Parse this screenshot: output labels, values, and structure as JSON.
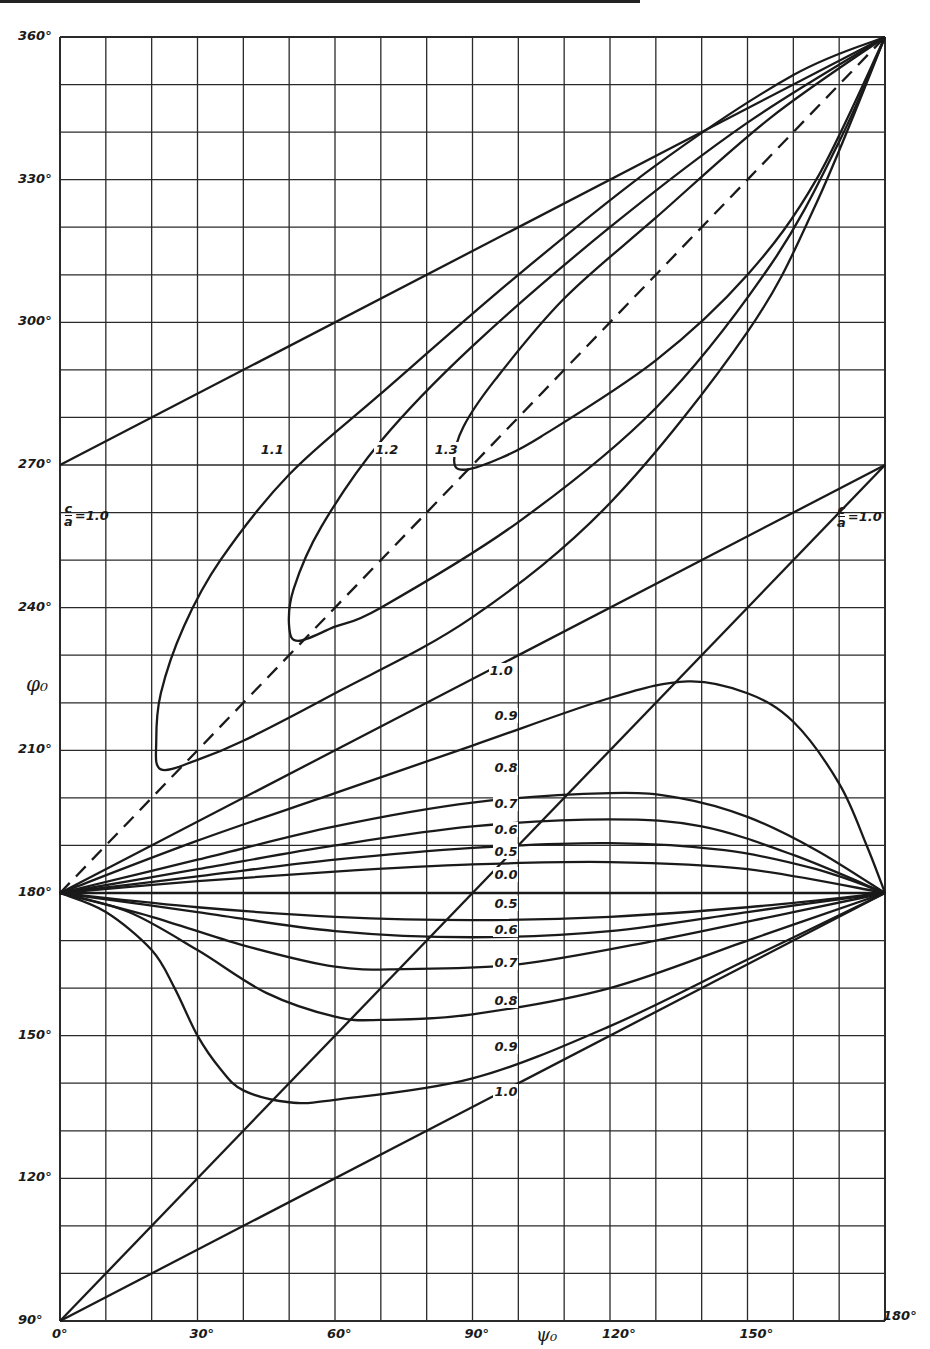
{
  "chart_data": {
    "type": "line",
    "title": "",
    "xlabel": "ψ₀",
    "ylabel": "φ₀",
    "xlim": [
      0,
      180
    ],
    "ylim": [
      90,
      360
    ],
    "grid": true,
    "grid_step": {
      "x": 10,
      "y": 10
    },
    "x_ticks": [
      {
        "value": 0,
        "label": "0°"
      },
      {
        "value": 30,
        "label": "30°"
      },
      {
        "value": 60,
        "label": "60°"
      },
      {
        "value": 90,
        "label": "90°"
      },
      {
        "value": 120,
        "label": "120°"
      },
      {
        "value": 150,
        "label": "150°"
      },
      {
        "value": 180,
        "label": "180°"
      }
    ],
    "y_ticks": [
      {
        "value": 360,
        "label": "360°"
      },
      {
        "value": 330,
        "label": "330°"
      },
      {
        "value": 300,
        "label": "300°"
      },
      {
        "value": 270,
        "label": "270°"
      },
      {
        "value": 240,
        "label": "240°"
      },
      {
        "value": 210,
        "label": "210°"
      },
      {
        "value": 180,
        "label": "180°"
      },
      {
        "value": 150,
        "label": "150°"
      },
      {
        "value": 120,
        "label": "120°"
      },
      {
        "value": 90,
        "label": "90°"
      }
    ],
    "parameter": "c/a",
    "series": [
      {
        "name": "c/a = 1.0 (upper bound)",
        "label": "",
        "dash": false,
        "points": [
          [
            0,
            270
          ],
          [
            180,
            360
          ]
        ]
      },
      {
        "name": "c/a = 1.0 (lower bound)",
        "label": "",
        "dash": false,
        "points": [
          [
            0,
            90
          ],
          [
            180,
            270
          ]
        ]
      },
      {
        "name": "diagonal",
        "label": "",
        "dash": true,
        "points": [
          [
            0,
            180
          ],
          [
            180,
            360
          ]
        ]
      },
      {
        "name": "1.1",
        "label": "1.1",
        "label_at": [
          44,
          273
        ],
        "dash": false,
        "points": [
          [
            180,
            360
          ],
          [
            160,
            352
          ],
          [
            130,
            333
          ],
          [
            100,
            310
          ],
          [
            70,
            285
          ],
          [
            50,
            268
          ],
          [
            35,
            250
          ],
          [
            27,
            236
          ],
          [
            22,
            222
          ],
          [
            21,
            212
          ],
          [
            22,
            206
          ],
          [
            30,
            208
          ],
          [
            40,
            212
          ],
          [
            60,
            222
          ],
          [
            90,
            238
          ],
          [
            120,
            262
          ],
          [
            150,
            298
          ],
          [
            165,
            325
          ],
          [
            180,
            360
          ]
        ]
      },
      {
        "name": "1.2",
        "label": "1.2",
        "label_at": [
          69,
          273
        ],
        "dash": false,
        "points": [
          [
            180,
            360
          ],
          [
            150,
            342
          ],
          [
            120,
            320
          ],
          [
            90,
            295
          ],
          [
            70,
            275
          ],
          [
            57,
            257
          ],
          [
            51,
            244
          ],
          [
            50,
            236
          ],
          [
            52,
            233
          ],
          [
            60,
            236
          ],
          [
            70,
            240
          ],
          [
            100,
            258
          ],
          [
            130,
            282
          ],
          [
            155,
            312
          ],
          [
            170,
            338
          ],
          [
            180,
            360
          ]
        ]
      },
      {
        "name": "1.3",
        "label": "1.3",
        "label_at": [
          82,
          273
        ],
        "dash": false,
        "points": [
          [
            180,
            360
          ],
          [
            155,
            343
          ],
          [
            130,
            322
          ],
          [
            110,
            305
          ],
          [
            95,
            288
          ],
          [
            88,
            278
          ],
          [
            86,
            271
          ],
          [
            88,
            269
          ],
          [
            95,
            271
          ],
          [
            105,
            276
          ],
          [
            130,
            292
          ],
          [
            150,
            310
          ],
          [
            165,
            330
          ],
          [
            180,
            360
          ]
        ]
      },
      {
        "name": "1.0 (upper fan)",
        "label": "1.0",
        "label_at": [
          94,
          226.5
        ],
        "dash": false,
        "points": [
          [
            0,
            180
          ],
          [
            180,
            270
          ]
        ]
      },
      {
        "name": "0.9 (upper)",
        "label": "0.9",
        "label_at": [
          95,
          217
        ],
        "dash": false,
        "points": [
          [
            0,
            180
          ],
          [
            30,
            191
          ],
          [
            60,
            201
          ],
          [
            90,
            211
          ],
          [
            120,
            221
          ],
          [
            137,
            224.5
          ],
          [
            150,
            222
          ],
          [
            160,
            216
          ],
          [
            170,
            203
          ],
          [
            176,
            190
          ],
          [
            180,
            180
          ]
        ]
      },
      {
        "name": "0.8 (upper)",
        "label": "0.8",
        "label_at": [
          95,
          206
        ],
        "dash": false,
        "points": [
          [
            0,
            180
          ],
          [
            30,
            187
          ],
          [
            60,
            194
          ],
          [
            90,
            199
          ],
          [
            120,
            201
          ],
          [
            135,
            200
          ],
          [
            150,
            196
          ],
          [
            165,
            189
          ],
          [
            180,
            180
          ]
        ]
      },
      {
        "name": "0.7 (upper)",
        "label": "0.7",
        "label_at": [
          95,
          198.5
        ],
        "dash": false,
        "points": [
          [
            0,
            180
          ],
          [
            30,
            185
          ],
          [
            60,
            190
          ],
          [
            90,
            194
          ],
          [
            120,
            195.5
          ],
          [
            140,
            194
          ],
          [
            160,
            188
          ],
          [
            180,
            180
          ]
        ]
      },
      {
        "name": "0.6 (upper)",
        "label": "0.6",
        "label_at": [
          95,
          193
        ],
        "dash": false,
        "points": [
          [
            0,
            180
          ],
          [
            30,
            183.5
          ],
          [
            60,
            187
          ],
          [
            90,
            189.5
          ],
          [
            120,
            190.5
          ],
          [
            145,
            189
          ],
          [
            165,
            185
          ],
          [
            180,
            180
          ]
        ]
      },
      {
        "name": "0.5 (upper)",
        "label": "0.5",
        "label_at": [
          95,
          188.5
        ],
        "dash": false,
        "points": [
          [
            0,
            180
          ],
          [
            30,
            182.5
          ],
          [
            60,
            184.5
          ],
          [
            90,
            186
          ],
          [
            120,
            186.5
          ],
          [
            150,
            185
          ],
          [
            180,
            180
          ]
        ]
      },
      {
        "name": "0.0",
        "label": "0.0",
        "label_at": [
          95,
          183.5
        ],
        "dash": false,
        "points": [
          [
            0,
            180
          ],
          [
            180,
            180
          ]
        ]
      },
      {
        "name": "0.5 (lower)",
        "label": "0.5",
        "label_at": [
          95,
          177.5
        ],
        "dash": false,
        "points": [
          [
            0,
            180
          ],
          [
            30,
            177
          ],
          [
            60,
            175
          ],
          [
            90,
            174.3
          ],
          [
            120,
            175
          ],
          [
            150,
            177
          ],
          [
            180,
            180
          ]
        ]
      },
      {
        "name": "0.6 (lower)",
        "label": "0.6",
        "label_at": [
          95,
          172
        ],
        "dash": false,
        "points": [
          [
            0,
            180
          ],
          [
            30,
            176
          ],
          [
            60,
            172
          ],
          [
            90,
            170.7
          ],
          [
            120,
            172
          ],
          [
            150,
            176
          ],
          [
            180,
            180
          ]
        ]
      },
      {
        "name": "0.7 (lower)",
        "label": "0.7",
        "label_at": [
          95,
          165
        ],
        "dash": false,
        "points": [
          [
            0,
            180
          ],
          [
            20,
            175
          ],
          [
            40,
            169
          ],
          [
            60,
            164.5
          ],
          [
            75,
            164
          ],
          [
            100,
            165
          ],
          [
            130,
            170
          ],
          [
            160,
            176
          ],
          [
            180,
            180
          ]
        ]
      },
      {
        "name": "0.8 (lower)",
        "label": "0.8",
        "label_at": [
          95,
          157
        ],
        "dash": false,
        "points": [
          [
            0,
            180
          ],
          [
            15,
            176
          ],
          [
            30,
            168
          ],
          [
            45,
            159
          ],
          [
            60,
            154
          ],
          [
            70,
            153.3
          ],
          [
            90,
            154.5
          ],
          [
            120,
            160
          ],
          [
            150,
            170
          ],
          [
            180,
            180
          ]
        ]
      },
      {
        "name": "0.9 (lower)",
        "label": "0.9",
        "label_at": [
          95,
          147.5
        ],
        "dash": false,
        "points": [
          [
            0,
            180
          ],
          [
            10,
            176
          ],
          [
            20,
            168
          ],
          [
            25,
            160
          ],
          [
            30,
            150
          ],
          [
            35,
            143
          ],
          [
            40,
            138.5
          ],
          [
            50,
            136
          ],
          [
            60,
            136.5
          ],
          [
            90,
            141
          ],
          [
            120,
            152
          ],
          [
            150,
            166
          ],
          [
            180,
            180
          ]
        ]
      },
      {
        "name": "1.0 (lower fan)",
        "label": "1.0",
        "label_at": [
          95,
          138
        ],
        "dash": false,
        "points": [
          [
            0,
            90
          ],
          [
            180,
            180
          ]
        ]
      }
    ],
    "side_labels": [
      {
        "text": "c/a = 1.0",
        "num": "c",
        "den": "a",
        "rest": "=1.0",
        "position": "left",
        "psi": 0,
        "phi": 253
      },
      {
        "text": "c/a = 1.0",
        "num": "c",
        "den": "a",
        "rest": "=1.0",
        "position": "right",
        "psi": 180,
        "phi": 255
      }
    ]
  },
  "axis": {
    "x_title": "ψ₀",
    "y_title": "φ₀"
  },
  "style": {
    "ink": "#1a1a1a",
    "grid": "#2a2a2a",
    "background": "#ffffff"
  }
}
